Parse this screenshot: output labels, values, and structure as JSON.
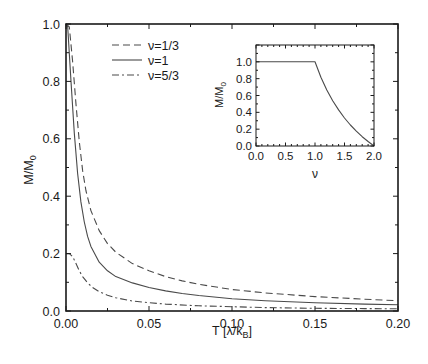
{
  "chart_data": [
    {
      "id": "main",
      "type": "line",
      "title": "",
      "xlabel": "T [λ/k_B]",
      "xlabel_main": "T [λ/k",
      "xlabel_sub": "B",
      "xlabel_end": "]",
      "ylabel_main": "M/M",
      "ylabel_sub": "0",
      "xlim": [
        0,
        0.2
      ],
      "ylim": [
        0,
        1.0
      ],
      "xticks": [
        "0.00",
        "0.05",
        "0.10",
        "0.15",
        "0.20"
      ],
      "yticks": [
        "0.0",
        "0.2",
        "0.4",
        "0.6",
        "0.8",
        "1.0"
      ],
      "grid": false,
      "legend_position": "upper-left-inside",
      "series": [
        {
          "name": "ν=1/3",
          "style": "dashed",
          "x": [
            0.0,
            0.002,
            0.004,
            0.006,
            0.008,
            0.01,
            0.012,
            0.015,
            0.02,
            0.025,
            0.03,
            0.04,
            0.05,
            0.06,
            0.07,
            0.08,
            0.1,
            0.12,
            0.15,
            0.18,
            0.2
          ],
          "y": [
            1.0,
            0.99,
            0.87,
            0.72,
            0.59,
            0.49,
            0.42,
            0.35,
            0.28,
            0.235,
            0.205,
            0.165,
            0.14,
            0.12,
            0.105,
            0.093,
            0.075,
            0.063,
            0.05,
            0.041,
            0.036
          ]
        },
        {
          "name": "ν=1",
          "style": "solid",
          "x": [
            0.0,
            0.001,
            0.003,
            0.005,
            0.007,
            0.009,
            0.011,
            0.013,
            0.015,
            0.02,
            0.025,
            0.03,
            0.04,
            0.05,
            0.06,
            0.07,
            0.08,
            0.1,
            0.12,
            0.15,
            0.18,
            0.2
          ],
          "y": [
            1.0,
            0.99,
            0.8,
            0.62,
            0.48,
            0.38,
            0.31,
            0.26,
            0.225,
            0.17,
            0.14,
            0.12,
            0.098,
            0.082,
            0.07,
            0.061,
            0.054,
            0.043,
            0.036,
            0.029,
            0.024,
            0.022
          ]
        },
        {
          "name": "ν=5/3",
          "style": "dashdot",
          "x": [
            0.0,
            0.002,
            0.004,
            0.006,
            0.008,
            0.01,
            0.013,
            0.016,
            0.02,
            0.025,
            0.03,
            0.04,
            0.05,
            0.06,
            0.08,
            0.1,
            0.12,
            0.15,
            0.18,
            0.2
          ],
          "y": [
            0.2,
            0.2,
            0.19,
            0.165,
            0.14,
            0.12,
            0.098,
            0.082,
            0.067,
            0.055,
            0.046,
            0.035,
            0.029,
            0.024,
            0.018,
            0.015,
            0.012,
            0.0095,
            0.0082,
            0.0075
          ]
        }
      ]
    },
    {
      "id": "inset",
      "type": "line",
      "title": "",
      "xlabel": "ν",
      "ylabel_main": "M/M",
      "ylabel_sub": "0",
      "xlim": [
        0,
        2.0
      ],
      "ylim": [
        0,
        1.2
      ],
      "xticks": [
        "0.0",
        "0.5",
        "1.0",
        "1.5",
        "2.0"
      ],
      "yticks": [
        "0.0",
        "0.2",
        "0.4",
        "0.6",
        "0.8",
        "1.0"
      ],
      "grid": false,
      "series": [
        {
          "name": "M/M0 vs ν",
          "style": "solid",
          "x": [
            0.0,
            1.0,
            1.1,
            1.2,
            1.3,
            1.4,
            1.5,
            1.6,
            1.7,
            1.8,
            1.9,
            2.0
          ],
          "y": [
            1.0,
            1.0,
            0.818,
            0.667,
            0.538,
            0.429,
            0.333,
            0.25,
            0.176,
            0.111,
            0.053,
            0.0
          ]
        }
      ]
    }
  ],
  "legend": [
    {
      "label": "ν=1/3",
      "style": "dashed"
    },
    {
      "label": "ν=1",
      "style": "solid"
    },
    {
      "label": "ν=5/3",
      "style": "dashdot"
    }
  ],
  "colors": {
    "line": "#4a4a4a",
    "axis": "#1a1a1a"
  }
}
